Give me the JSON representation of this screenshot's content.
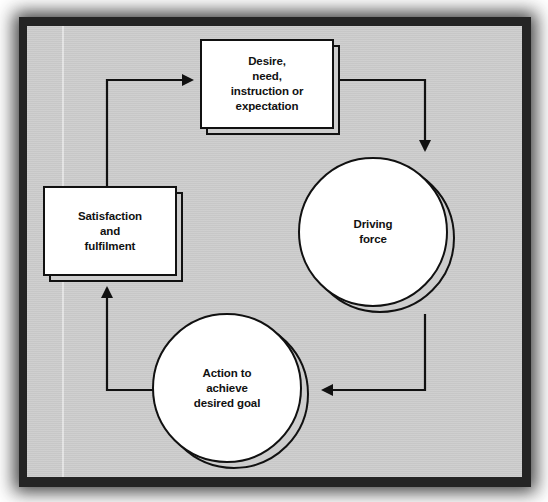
{
  "figure": {
    "frame_color": "#242424",
    "canvas_color": "#cdcdcd",
    "line_color": "#111111",
    "node_fill": "#ffffff"
  },
  "nodes": {
    "desire": {
      "id": "desire-need-instruction-expectation",
      "shape": "rectangle",
      "label": "Desire,\nneed,\ninstruction or\nexpectation"
    },
    "driving_force": {
      "id": "driving-force",
      "shape": "circle",
      "label": "Driving\nforce"
    },
    "action": {
      "id": "action-to-achieve-desired-goal",
      "shape": "circle",
      "label": "Action to\nachieve\ndesired goal"
    },
    "satisfaction": {
      "id": "satisfaction-and-fulfilment",
      "shape": "rectangle",
      "label": "Satisfaction\nand\nfulfilment"
    }
  },
  "connectors": [
    {
      "id": "desire-to-driving-force",
      "from": "desire",
      "to": "driving_force",
      "arrow": "down"
    },
    {
      "id": "driving-force-to-action",
      "from": "driving_force",
      "to": "action",
      "arrow": "left"
    },
    {
      "id": "action-to-satisfaction",
      "from": "action",
      "to": "satisfaction",
      "arrow": "up"
    },
    {
      "id": "satisfaction-to-desire",
      "from": "satisfaction",
      "to": "desire",
      "arrow": "right"
    }
  ]
}
